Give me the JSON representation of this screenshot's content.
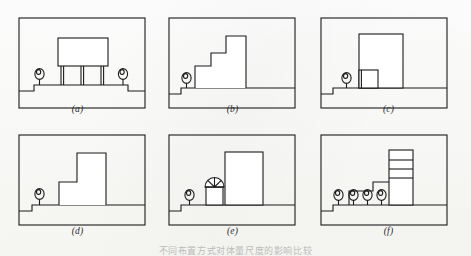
{
  "figure": {
    "caption": "不同布置方式对体量尺度的影响比较",
    "panel_label_a": "(a)",
    "panel_label_b": "(b)",
    "panel_label_c": "(c)",
    "panel_label_d": "(d)",
    "panel_label_e": "(e)",
    "panel_label_f": "(f)",
    "line_color": "#1b1b1b",
    "fill_color": "#ffffff",
    "paper_color": "#fbfbf9"
  },
  "panels": [
    {
      "id": "a",
      "label": "(a)",
      "description": "Large rectangular slab block raised on four slender columns above a stepped ground line, with one human scale figure at left and one at right",
      "human_figures": 2,
      "building_volumes": 1,
      "columns": 4,
      "ground_steps": 2
    },
    {
      "id": "b",
      "label": "(b)",
      "description": "Three ascending stepped blocks of increasing height rising from left to right, one human scale figure at far left on the low step",
      "human_figures": 1,
      "building_volumes": 3,
      "columns": 0,
      "ground_steps": 1
    },
    {
      "id": "c",
      "label": "(c)",
      "description": "Single tall rectangular block with a small low annex box at its left base, one human scale figure at left",
      "human_figures": 1,
      "building_volumes": 2,
      "columns": 0,
      "ground_steps": 1
    },
    {
      "id": "d",
      "label": "(d)",
      "description": "Two stepped blocks, a low wide one at left joined to a tall narrow one at right, one human scale figure at left",
      "human_figures": 1,
      "building_volumes": 2,
      "columns": 0,
      "ground_steps": 1
    },
    {
      "id": "e",
      "label": "(e)",
      "description": "Tall rectangular block at right with a small pavilion capped by a semicircular fan-light arch at its left, one human scale figure at far left",
      "human_figures": 1,
      "building_volumes": 2,
      "arch_elements": 1,
      "ground_steps": 1
    },
    {
      "id": "f",
      "label": "(f)",
      "description": "Stepped low blocks rising to a tall block divided into four stacked floor bands, four human scale figures lined up along the ground",
      "human_figures": 4,
      "building_volumes": 3,
      "floor_bands": 4,
      "ground_steps": 1
    }
  ]
}
